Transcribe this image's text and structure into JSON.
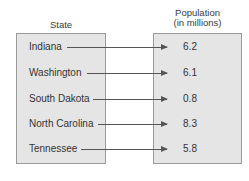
{
  "headers": {
    "state": "State",
    "population_line1": "Population",
    "population_line2": "(in millions)"
  },
  "rows": [
    {
      "state": "Indiana",
      "population": "6.2"
    },
    {
      "state": "Washington",
      "population": "6.1"
    },
    {
      "state": "South Dakota",
      "population": "0.8"
    },
    {
      "state": "North Carolina",
      "population": "8.3"
    },
    {
      "state": "Tennessee",
      "population": "5.8"
    }
  ],
  "colors": {
    "box_fill": "#e5e5e5",
    "box_border": "#9a9a9a",
    "text": "#333333",
    "arrow": "#555555"
  }
}
